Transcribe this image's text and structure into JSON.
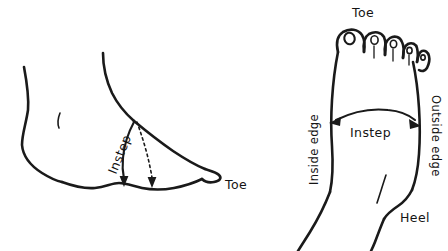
{
  "figure": {
    "background_color": "#ffffff",
    "ink_color": "#1a1a1a"
  },
  "side_view": {
    "name": "side-profile-foot",
    "labels": {
      "instep": "Instep",
      "toe": "Toe"
    },
    "annotations": {
      "instep_arrow": "solid curved arrow from instep label down to sole",
      "instep_dotted_arrow": "dotted vertical arrow from top of instep down to sole"
    }
  },
  "top_view": {
    "name": "top-view-foot",
    "labels": {
      "toe": "Toe",
      "instep": "Instep",
      "heel": "Heel",
      "inside_edge": "Inside edge",
      "outside_edge": "Outside edge"
    },
    "annotations": {
      "instep_arrow": "double-headed curved arrow spanning the instep across the foot"
    },
    "toe_count": 5
  }
}
